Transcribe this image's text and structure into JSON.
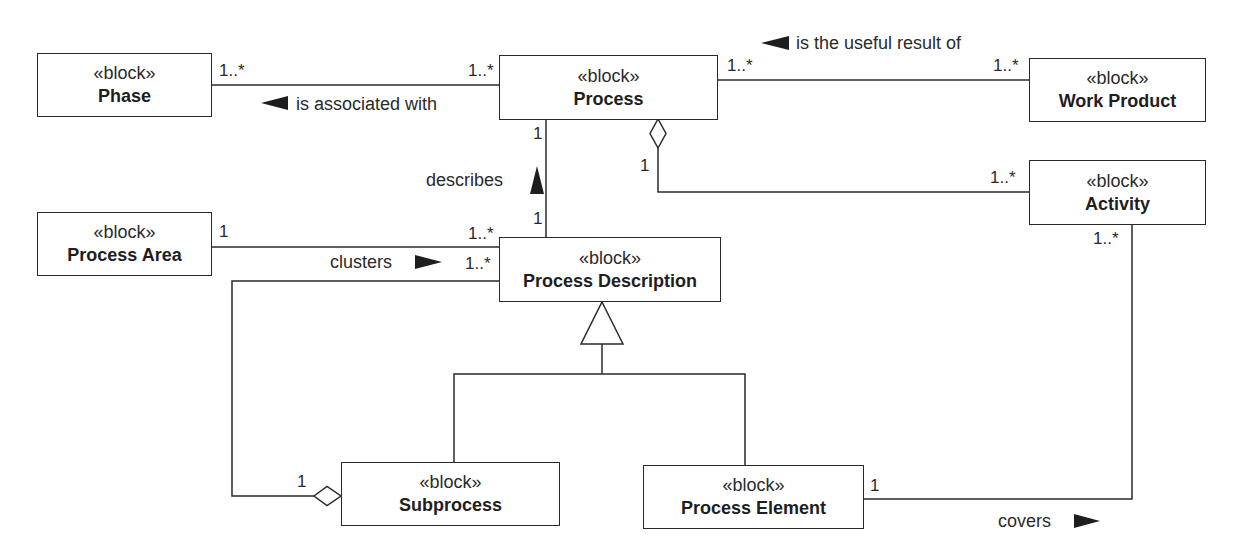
{
  "diagram": {
    "type": "SysML block definition diagram",
    "stroke_color": "#2a2a2a",
    "blocks": [
      {
        "id": "phase",
        "stereotype": "«block»",
        "name": "Phase"
      },
      {
        "id": "process",
        "stereotype": "«block»",
        "name": "Process"
      },
      {
        "id": "work_product",
        "stereotype": "«block»",
        "name": "Work Product"
      },
      {
        "id": "activity",
        "stereotype": "«block»",
        "name": "Activity"
      },
      {
        "id": "process_area",
        "stereotype": "«block»",
        "name": "Process Area"
      },
      {
        "id": "process_description",
        "stereotype": "«block»",
        "name": "Process Description"
      },
      {
        "id": "subprocess",
        "stereotype": "«block»",
        "name": "Subprocess"
      },
      {
        "id": "process_element",
        "stereotype": "«block»",
        "name": "Process Element"
      }
    ],
    "associations": [
      {
        "from": "Phase",
        "to": "Process",
        "label": "is associated with",
        "direction_arrow": "left",
        "from_mult": "1..*",
        "to_mult": "1..*"
      },
      {
        "from": "Process",
        "to": "Work Product",
        "label": "is the useful result of",
        "direction_arrow": "left",
        "from_mult": "1..*",
        "to_mult": "1..*"
      },
      {
        "from": "Process",
        "to": "Activity",
        "kind": "aggregation",
        "from_mult": "1",
        "to_mult": "1..*"
      },
      {
        "from": "Process Description",
        "to": "Process",
        "label": "describes",
        "direction_arrow": "up",
        "from_mult": "1",
        "to_mult": "1"
      },
      {
        "from": "Process Area",
        "to": "Process Description",
        "label": "clusters",
        "direction_arrow": "right",
        "from_mult": "1",
        "to_mult": "1..*"
      },
      {
        "from": "Subprocess",
        "to": "Process Description",
        "kind": "aggregation",
        "from_mult": "1",
        "to_mult": "1..*"
      },
      {
        "from": "Process Element",
        "to": "Activity",
        "label": "covers",
        "direction_arrow": "right",
        "from_mult": "1",
        "to_mult": "1..*"
      },
      {
        "from": "Subprocess",
        "to": "Process Description",
        "kind": "generalization"
      },
      {
        "from": "Process Element",
        "to": "Process Description",
        "kind": "generalization"
      }
    ],
    "labels": {
      "is_associated_with": "is associated with",
      "is_useful_result_of": "is the useful result of",
      "describes": "describes",
      "clusters": "clusters",
      "covers": "covers"
    },
    "multiplicities": {
      "phase_process_left": "1..*",
      "phase_process_right": "1..*",
      "process_wp_left": "1..*",
      "process_wp_right": "1..*",
      "process_desc_top": "1",
      "process_desc_bottom": "1",
      "process_activity_agg": "1",
      "process_activity_right": "1..*",
      "area_desc_left": "1",
      "area_desc_right": "1..*",
      "sub_desc_right": "1..*",
      "sub_agg": "1",
      "activity_bottom": "1..*",
      "element_right": "1"
    }
  }
}
